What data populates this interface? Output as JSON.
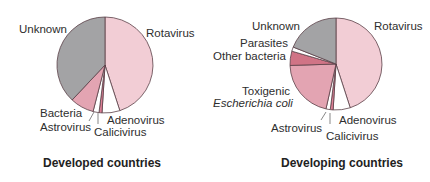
{
  "chart_data": [
    {
      "type": "pie",
      "title": "Developed countries",
      "start_angle_deg": 0,
      "direction": "clockwise",
      "slices": [
        {
          "label": "Rotavirus",
          "value": 45,
          "color": "#f2cdd5"
        },
        {
          "label": "Adenovirus",
          "value": 6,
          "color": "#ffffff"
        },
        {
          "label": "Calicivirus",
          "value": 1,
          "color": "#dd7f95"
        },
        {
          "label": "Astrovirus",
          "value": 2,
          "color": "#ffffff"
        },
        {
          "label": "Bacteria",
          "value": 8,
          "color": "#e3a4b2"
        },
        {
          "label": "Unknown",
          "value": 38,
          "color": "#a3a3a5"
        }
      ]
    },
    {
      "type": "pie",
      "title": "Developing countries",
      "start_angle_deg": 0,
      "direction": "clockwise",
      "slices": [
        {
          "label": "Rotavirus",
          "value": 45,
          "color": "#f2cdd5"
        },
        {
          "label": "Adenovirus",
          "value": 6,
          "color": "#ffffff"
        },
        {
          "label": "Calicivirus",
          "value": 1,
          "color": "#dd7f95"
        },
        {
          "label": "Astrovirus",
          "value": 1.5,
          "color": "#ffffff"
        },
        {
          "label": "Toxigenic Escherichia coli",
          "value": 21,
          "color": "#e3a4b2"
        },
        {
          "label": "Other bacteria",
          "value": 5,
          "color": "#d07486"
        },
        {
          "label": "Parasites",
          "value": 1.5,
          "color": "#ffffff"
        },
        {
          "label": "Unknown",
          "value": 19,
          "color": "#a3a3a5"
        }
      ]
    }
  ],
  "left": {
    "title": "Developed countries",
    "labels": {
      "unknown": "Unknown",
      "rotavirus": "Rotavirus",
      "bacteria": "Bacteria",
      "astrovirus": "Astrovirus",
      "adenovirus": "Adenovirus",
      "calicivirus": "Calicivirus"
    }
  },
  "right": {
    "title": "Developing countries",
    "labels": {
      "unknown": "Unknown",
      "rotavirus": "Rotavirus",
      "parasites": "Parasites",
      "other_bacteria": "Other bacteria",
      "toxigenic": "Toxigenic",
      "ecoli": "Escherichia coli",
      "astrovirus": "Astrovirus",
      "adenovirus": "Adenovirus",
      "calicivirus": "Calicivirus"
    }
  },
  "style": {
    "stroke": "#5a4048"
  }
}
